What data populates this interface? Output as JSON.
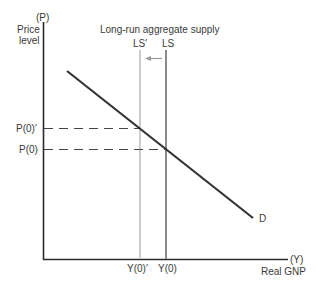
{
  "diagram": {
    "title": "Long-run aggregate supply",
    "y_axis": {
      "symbol": "(P)",
      "label_line1": "Price",
      "label_line2": "level"
    },
    "x_axis": {
      "symbol": "(Y)",
      "label": "Real GNP"
    },
    "curves": {
      "demand": {
        "label": "D"
      },
      "ls_new": {
        "label": "LS′",
        "color": "#c8c8c8"
      },
      "ls_original": {
        "label": "LS",
        "color": "#8a8a8a"
      }
    },
    "price_ticks": {
      "p0_prime": "P(0)′",
      "p0": "P(0)"
    },
    "output_ticks": {
      "y0_prime": "Y(0)′",
      "y0": "Y(0)"
    },
    "shift_arrow": {
      "direction": "left",
      "color": "#8a8a8a"
    }
  }
}
